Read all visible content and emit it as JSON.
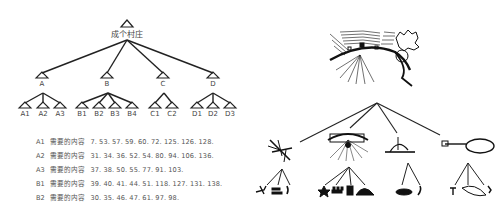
{
  "tree": {
    "root": {
      "label": "成个村庄"
    },
    "level1": [
      {
        "label": "A",
        "children": [
          "A1",
          "A2",
          "A3"
        ]
      },
      {
        "label": "B",
        "children": [
          "B1",
          "B2",
          "B3",
          "B4"
        ]
      },
      {
        "label": "C",
        "children": [
          "C1",
          "C2"
        ]
      },
      {
        "label": "D",
        "children": [
          "D1",
          "D2",
          "D3"
        ]
      }
    ]
  },
  "content_rows": [
    {
      "id": "A1",
      "label": "需要的内容",
      "values": "7. 53. 57. 59. 60. 72. 125. 126. 128."
    },
    {
      "id": "A2",
      "label": "需要的内容",
      "values": "31. 34. 36. 52. 54. 80. 94. 106. 136."
    },
    {
      "id": "A3",
      "label": "需要的内容",
      "values": "37. 38. 50. 55. 77. 91. 103."
    },
    {
      "id": "B1",
      "label": "需要的内容",
      "values": "39. 40. 41. 44. 51. 118. 127. 131. 138."
    },
    {
      "id": "B2",
      "label": "需要的内容",
      "values": "30. 35. 46. 47. 61. 97. 98."
    }
  ],
  "illustration": {
    "top": "village-landscape-sketch",
    "middle": [
      "tree-sketch",
      "settlement-sketch",
      "well-sketch",
      "pond-sketch"
    ],
    "bottom": [
      [
        "tree-branch",
        "fence",
        "figure"
      ],
      [
        "star-plant",
        "huts",
        "hut",
        "mound"
      ],
      [
        "bowl",
        "figure"
      ],
      [
        "plant",
        "loop-path",
        "marker"
      ]
    ]
  }
}
